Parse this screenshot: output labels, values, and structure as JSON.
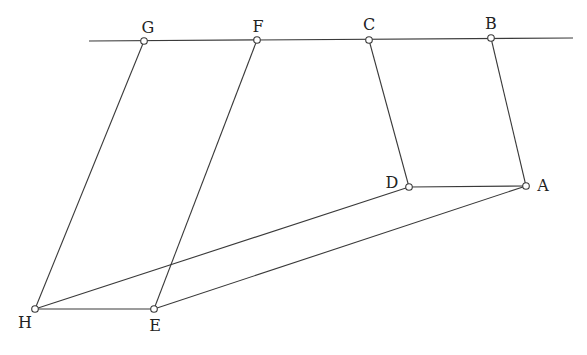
{
  "diagram": {
    "type": "geometric-construction",
    "colors": {
      "line": "#3a3a3a",
      "point_fill": "#ffffff",
      "point_stroke": "#3a3a3a",
      "label": "#222222"
    },
    "baseline": {
      "x1": 89,
      "y1": 41,
      "x2": 573,
      "y2": 38
    },
    "points": [
      {
        "id": "G",
        "label": "G",
        "x": 144,
        "y": 41,
        "lx": 148,
        "ly": 28
      },
      {
        "id": "F",
        "label": "F",
        "x": 257,
        "y": 40,
        "lx": 258,
        "ly": 27
      },
      {
        "id": "C",
        "label": "C",
        "x": 369,
        "y": 40,
        "lx": 369,
        "ly": 25
      },
      {
        "id": "B",
        "label": "B",
        "x": 491,
        "y": 38,
        "lx": 491,
        "ly": 24
      },
      {
        "id": "D",
        "label": "D",
        "x": 409,
        "y": 187,
        "lx": 392,
        "ly": 183
      },
      {
        "id": "A",
        "label": "A",
        "x": 526,
        "y": 186,
        "lx": 543,
        "ly": 186
      },
      {
        "id": "H",
        "label": "H",
        "x": 35,
        "y": 309,
        "lx": 25,
        "ly": 323
      },
      {
        "id": "E",
        "label": "E",
        "x": 154,
        "y": 309,
        "lx": 155,
        "ly": 326
      }
    ],
    "segments": [
      [
        "G",
        "H"
      ],
      [
        "F",
        "E"
      ],
      [
        "C",
        "D"
      ],
      [
        "B",
        "A"
      ],
      [
        "D",
        "A"
      ],
      [
        "H",
        "E"
      ],
      [
        "H",
        "D"
      ],
      [
        "E",
        "A"
      ]
    ]
  }
}
